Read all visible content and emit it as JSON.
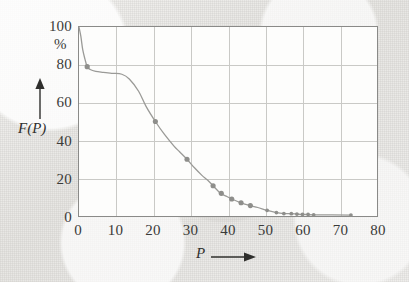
{
  "figure": {
    "background_color": "#eeedeb",
    "plot_background_color": "#fdfdfc",
    "frame_color": "#8a8a88",
    "grid_color": "#c9c9c6",
    "curve_color": "#9a9a97",
    "marker_color": "#8e8e8b",
    "y_unit_label": "%",
    "y_axis_arrow": "up-arrow",
    "x_axis_arrow": "right-arrow"
  },
  "chart_data": {
    "type": "line",
    "title": "",
    "subtitle": "",
    "xlabel": "P",
    "ylabel": "F(P)",
    "y_unit": "%",
    "xlim": [
      0,
      80
    ],
    "ylim": [
      0,
      100
    ],
    "xticks": [
      0,
      10,
      20,
      30,
      40,
      50,
      60,
      70,
      80
    ],
    "xtick_labels": [
      "0",
      "10",
      "20",
      "30",
      "40",
      "50",
      "60",
      "70",
      "80"
    ],
    "yticks": [
      0,
      20,
      40,
      60,
      80,
      100
    ],
    "ytick_labels": [
      "0",
      "20",
      "40",
      "60",
      "80",
      "100"
    ],
    "grid": true,
    "grid_x_step": 10,
    "grid_y_step": 20,
    "legend": null,
    "legend_position": "none",
    "series": [
      {
        "name": "F(P)",
        "style": "line-with-markers",
        "x": [
          0.0,
          0.5,
          1.0,
          1.6,
          2.2,
          3.0,
          4.5,
          6.5,
          9.0,
          11.5,
          13.5,
          16.0,
          18.0,
          20.5,
          23.0,
          25.5,
          27.0,
          29.0,
          31.0,
          33.0,
          34.5,
          36.0,
          38.0,
          39.5,
          41.0,
          43.5,
          46.0,
          48.0,
          50.5,
          53.0,
          55.0,
          57.0,
          58.5,
          60.0,
          61.5,
          63.0,
          73.0
        ],
        "y": [
          100.0,
          95.0,
          88.0,
          83.0,
          79.0,
          77.5,
          76.5,
          76.0,
          75.5,
          75.0,
          72.5,
          66.0,
          58.0,
          50.0,
          43.0,
          37.0,
          34.0,
          30.0,
          25.5,
          21.5,
          19.0,
          16.0,
          12.0,
          10.5,
          9.0,
          7.0,
          5.5,
          4.5,
          3.0,
          1.8,
          1.3,
          1.2,
          1.0,
          0.8,
          0.8,
          0.6,
          0.5
        ]
      }
    ],
    "markers": [
      {
        "x": 2.2,
        "y": 79.0
      },
      {
        "x": 20.5,
        "y": 50.0
      },
      {
        "x": 29.0,
        "y": 30.0
      },
      {
        "x": 36.0,
        "y": 16.0
      },
      {
        "x": 38.2,
        "y": 12.0
      },
      {
        "x": 41.0,
        "y": 9.0
      },
      {
        "x": 43.5,
        "y": 7.0
      },
      {
        "x": 46.0,
        "y": 5.5
      },
      {
        "x": 50.5,
        "y": 3.0
      },
      {
        "x": 53.0,
        "y": 1.8
      },
      {
        "x": 55.0,
        "y": 1.3
      },
      {
        "x": 57.0,
        "y": 1.2
      },
      {
        "x": 58.5,
        "y": 1.0
      },
      {
        "x": 60.0,
        "y": 0.9
      },
      {
        "x": 61.5,
        "y": 0.8
      },
      {
        "x": 63.0,
        "y": 0.6
      },
      {
        "x": 73.0,
        "y": 0.5
      }
    ]
  }
}
